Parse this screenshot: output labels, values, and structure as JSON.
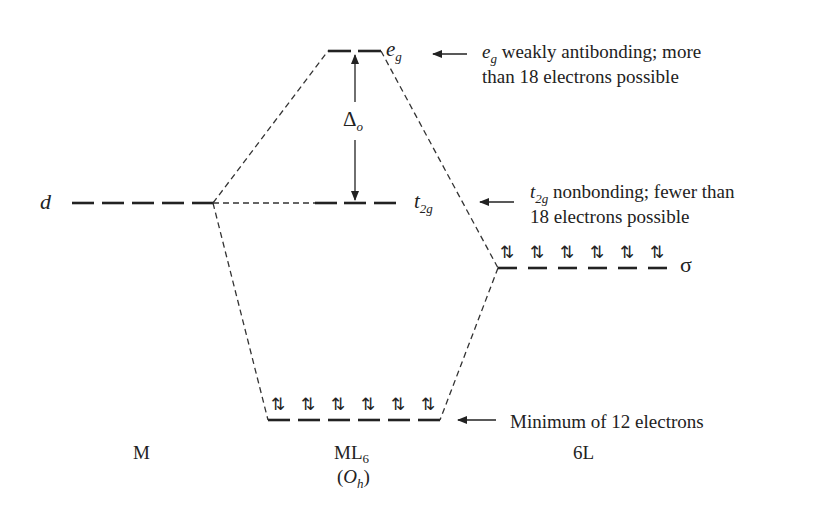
{
  "diagram": {
    "columns": {
      "metal": "M",
      "complex": "ML",
      "complex_sub": "6",
      "complex_symmetry_prefix": "(",
      "complex_symmetry": "O",
      "complex_symmetry_sub": "h",
      "complex_symmetry_suffix": ")",
      "ligands": "6L"
    },
    "levels": {
      "metal_d": {
        "label": "d"
      },
      "eg": {
        "label": "e",
        "label_sub": "g"
      },
      "t2g": {
        "label": "t",
        "label_sub": "2g"
      },
      "sigma": {
        "label": "σ",
        "electron_pairs": 6
      },
      "bonding": {
        "electron_pairs": 6
      }
    },
    "splitting": {
      "label": "Δ",
      "label_sub": "o"
    },
    "annotations": {
      "eg_note": {
        "symbol": "e",
        "symbol_sub": "g",
        "line1": " weakly antibonding; more",
        "line2": "than 18 electrons possible"
      },
      "t2g_note": {
        "symbol": "t",
        "symbol_sub": "2g",
        "line1": " nonbonding; fewer than",
        "line2": "18 electrons possible"
      },
      "bonding_note": {
        "text": "Minimum of 12 electrons"
      }
    },
    "electron_pair_glyph": "⇅",
    "colors": {
      "ink": "#222222",
      "background": "#ffffff"
    }
  }
}
